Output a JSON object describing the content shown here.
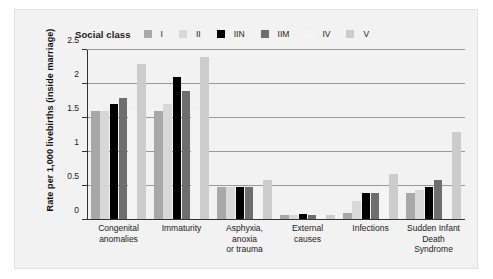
{
  "chart_data": {
    "type": "bar",
    "title": "",
    "xlabel": "",
    "ylabel": "Rate per 1,000 livebirths (inside marriage)",
    "legend_title": "Social class",
    "legend_position": "top",
    "grid": true,
    "ylim": [
      0,
      2.5
    ],
    "yticks": [
      "0",
      "0.5",
      "1",
      "1.5",
      "2",
      "2.5"
    ],
    "ytick_values": [
      0,
      0.5,
      1,
      1.5,
      2,
      2.5
    ],
    "categories": [
      "Congenital anomalies",
      "Immaturity",
      "Asphyxia, anoxia or trauma",
      "External causes",
      "Infections",
      "Sudden Infant Death Syndrome"
    ],
    "category_lines": [
      [
        "Congenital",
        "anomalies"
      ],
      [
        "Immaturity"
      ],
      [
        "Asphyxia,",
        "anoxia",
        "or trauma"
      ],
      [
        "External",
        "causes"
      ],
      [
        "Infections"
      ],
      [
        "Sudden Infant",
        "Death",
        "Syndrome"
      ]
    ],
    "series": [
      {
        "name": "I",
        "color": "#a8a8a8",
        "values": [
          1.6,
          1.6,
          0.48,
          0.08,
          0.1,
          0.4
        ]
      },
      {
        "name": "II",
        "color": "#d8d8d8",
        "values": [
          1.6,
          1.7,
          0.48,
          0.08,
          0.28,
          0.44
        ]
      },
      {
        "name": "IIN",
        "color": "#000000",
        "values": [
          1.7,
          2.1,
          0.49,
          0.09,
          0.39,
          0.49
        ]
      },
      {
        "name": "IIM",
        "color": "#6e6e6e",
        "values": [
          1.8,
          1.9,
          0.48,
          0.08,
          0.39,
          0.59
        ]
      },
      {
        "name": "IV",
        "color": "#f4f4f4",
        "values": [
          1.6,
          1.6,
          0.48,
          0.08,
          0.48,
          0.48
        ]
      },
      {
        "name": "V",
        "color": "#cccccc",
        "values": [
          2.3,
          2.4,
          0.59,
          0.08,
          0.68,
          1.29
        ]
      }
    ]
  }
}
